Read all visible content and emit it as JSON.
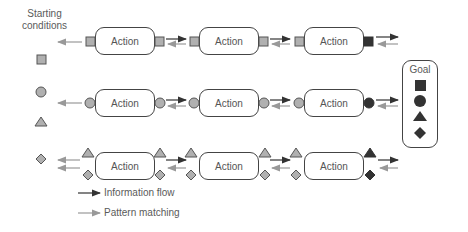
{
  "diagram": {
    "starting_conditions_label": "Starting conditions",
    "starting_conditions_line1": "Starting",
    "starting_conditions_line2": "conditions",
    "goal_label": "Goal",
    "action_label": "Action",
    "rows": [
      {
        "shape": "square",
        "actions": [
          "Action",
          "Action",
          "Action"
        ]
      },
      {
        "shape": "circle",
        "actions": [
          "Action",
          "Action",
          "Action"
        ]
      },
      {
        "shape": "triangle+diamond",
        "actions": [
          "Action",
          "Action",
          "Action"
        ]
      }
    ],
    "starting_shapes": [
      "square",
      "circle",
      "triangle",
      "diamond"
    ],
    "goal_shapes": [
      "square",
      "circle",
      "triangle",
      "diamond"
    ],
    "legend": [
      {
        "label": "Information flow",
        "color": "#333333"
      },
      {
        "label": "Pattern matching",
        "color": "#999999"
      }
    ],
    "colors": {
      "connector_fill": "#b0b0b0",
      "final_fill": "#333333",
      "border": "#444444"
    }
  }
}
